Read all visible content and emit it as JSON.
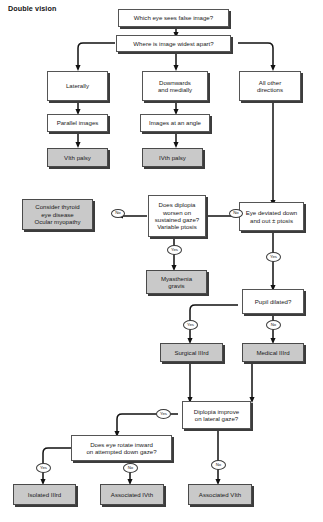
{
  "diagram": {
    "title": "Double vision",
    "type": "clinical-decision-flowchart",
    "colors": {
      "page_background": "#ffffff",
      "box_fill": "#ffffff",
      "outcome_fill": "#c9c9c9",
      "border": "#555555",
      "shadow": "#3c3c3c",
      "text": "#1a1a1a"
    },
    "nodes": [
      {
        "id": "n1",
        "kind": "question",
        "shaded": false,
        "lines": [
          "Which eye sees false image?"
        ]
      },
      {
        "id": "n2",
        "kind": "question",
        "shaded": false,
        "lines": [
          "Where is image widest apart?"
        ]
      },
      {
        "id": "n3",
        "kind": "state",
        "shaded": false,
        "lines": [
          "Laterally"
        ]
      },
      {
        "id": "n4",
        "kind": "state",
        "shaded": false,
        "lines": [
          "Downwards",
          "and medially"
        ]
      },
      {
        "id": "n5",
        "kind": "state",
        "shaded": false,
        "lines": [
          "All other",
          "directions"
        ]
      },
      {
        "id": "n6",
        "kind": "state",
        "shaded": false,
        "lines": [
          "Parallel images"
        ]
      },
      {
        "id": "n7",
        "kind": "state",
        "shaded": false,
        "lines": [
          "Images at an angle"
        ]
      },
      {
        "id": "n8",
        "kind": "outcome",
        "shaded": true,
        "lines": [
          "VIth palsy"
        ]
      },
      {
        "id": "n9",
        "kind": "outcome",
        "shaded": true,
        "lines": [
          "IVth palsy"
        ]
      },
      {
        "id": "n10",
        "kind": "outcome",
        "shaded": true,
        "lines": [
          "Consider thyroid",
          "eye disease",
          "Ocular myopathy"
        ]
      },
      {
        "id": "n11",
        "kind": "question",
        "shaded": false,
        "lines": [
          "Does diplopia",
          "worsen on",
          "sustained gaze?",
          "Variable ptosis"
        ]
      },
      {
        "id": "n12",
        "kind": "state",
        "shaded": false,
        "lines": [
          "Eye deviated down",
          "and out ± ptosis"
        ]
      },
      {
        "id": "n13",
        "kind": "outcome",
        "shaded": true,
        "lines": [
          "Myasthenia",
          "gravis"
        ]
      },
      {
        "id": "n14",
        "kind": "question",
        "shaded": false,
        "lines": [
          "Pupil dilated?"
        ]
      },
      {
        "id": "n15",
        "kind": "outcome",
        "shaded": true,
        "lines": [
          "Surgical IIIrd"
        ]
      },
      {
        "id": "n16",
        "kind": "outcome",
        "shaded": true,
        "lines": [
          "Medical IIIrd"
        ]
      },
      {
        "id": "n17",
        "kind": "question",
        "shaded": false,
        "lines": [
          "Diplopia improve",
          "on lateral gaze?"
        ]
      },
      {
        "id": "n18",
        "kind": "question",
        "shaded": false,
        "lines": [
          "Does eye rotate inward",
          "on attempted down gaze?"
        ]
      },
      {
        "id": "n19",
        "kind": "outcome",
        "shaded": true,
        "lines": [
          "Isolated IIIrd"
        ]
      },
      {
        "id": "n20",
        "kind": "outcome",
        "shaded": true,
        "lines": [
          "Associated IVth"
        ]
      },
      {
        "id": "n21",
        "kind": "outcome",
        "shaded": true,
        "lines": [
          "Associated VIth"
        ]
      }
    ],
    "edge_labels": [
      {
        "id": "e1",
        "text": "No",
        "from": "n11",
        "to": "n10"
      },
      {
        "id": "e2",
        "text": "No",
        "from": "n12",
        "to": "n11"
      },
      {
        "id": "e3",
        "text": "Yes",
        "from": "n11",
        "to": "n13"
      },
      {
        "id": "e4",
        "text": "Yes",
        "from": "n12",
        "to": "n14"
      },
      {
        "id": "e5",
        "text": "Yes",
        "from": "n14",
        "to": "n15"
      },
      {
        "id": "e6",
        "text": "No",
        "from": "n14",
        "to": "n16"
      },
      {
        "id": "e7",
        "text": "Yes",
        "from": "n17",
        "to": "n18"
      },
      {
        "id": "e8",
        "text": "No",
        "from": "n17",
        "to": "n21"
      },
      {
        "id": "e9",
        "text": "Yes",
        "from": "n18",
        "to": "n19"
      },
      {
        "id": "e10",
        "text": "No",
        "from": "n18",
        "to": "n20"
      }
    ]
  }
}
